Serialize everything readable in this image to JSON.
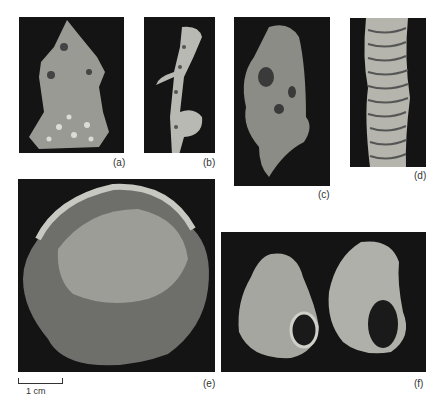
{
  "figure": {
    "panels": [
      {
        "id": "a",
        "label": "(a)",
        "description": "branching fossil fragment with knobbed surface"
      },
      {
        "id": "b",
        "label": "(b)",
        "description": "slender knobbed stem fossil"
      },
      {
        "id": "c",
        "label": "(c)",
        "description": "elongate fossil with fine reticulate surface"
      },
      {
        "id": "d",
        "label": "(d)",
        "description": "close-up of ridged column surface"
      },
      {
        "id": "e",
        "label": "(e)",
        "description": "large rounded fossil with dimpled surface"
      },
      {
        "id": "f",
        "label": "(f)",
        "description": "two small snail-like shells with apertures"
      }
    ],
    "scale_bar": {
      "label": "1 cm"
    }
  }
}
